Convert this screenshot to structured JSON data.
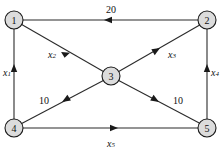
{
  "figure": {
    "kind": "directed-network-diagram",
    "width": 222,
    "height": 153,
    "background": "#ffffff"
  },
  "style": {
    "node_fill": "#dcdcdc",
    "node_stroke": "#1a1a1a",
    "edge_color": "#2b2b2b",
    "label_color": "#111111"
  },
  "nodes": [
    {
      "id": "1",
      "label": "1",
      "x": 14,
      "y": 20,
      "r": 9
    },
    {
      "id": "2",
      "label": "2",
      "x": 207,
      "y": 20,
      "r": 9
    },
    {
      "id": "3",
      "label": "3",
      "x": 111,
      "y": 76,
      "r": 9
    },
    {
      "id": "4",
      "label": "4",
      "x": 14,
      "y": 128,
      "r": 9
    },
    {
      "id": "5",
      "label": "5",
      "x": 207,
      "y": 128,
      "r": 9
    }
  ],
  "edges": [
    {
      "id": "e-2-1",
      "from": "2",
      "to": "1",
      "label": "20",
      "label_sub": "",
      "label_x": 111,
      "label_y": 9,
      "direction": "left"
    },
    {
      "id": "e-4-1",
      "from": "4",
      "to": "1",
      "label": "x",
      "label_sub": "1",
      "label_x": 7,
      "label_y": 72,
      "direction": "up"
    },
    {
      "id": "e-1-3",
      "from": "1",
      "to": "3",
      "label": "x",
      "label_sub": "2",
      "label_x": 52,
      "label_y": 54,
      "direction": "down-right"
    },
    {
      "id": "e-3-2",
      "from": "3",
      "to": "2",
      "label": "x",
      "label_sub": "3",
      "label_x": 172,
      "label_y": 54,
      "direction": "up-right"
    },
    {
      "id": "e-5-2",
      "from": "5",
      "to": "2",
      "label": "x",
      "label_sub": "4",
      "label_x": 214,
      "label_y": 72,
      "direction": "up"
    },
    {
      "id": "e-3-4",
      "from": "3",
      "to": "4",
      "label": "10",
      "label_sub": "",
      "label_x": 44,
      "label_y": 100,
      "direction": "down-left"
    },
    {
      "id": "e-3-5",
      "from": "3",
      "to": "5",
      "label": "10",
      "label_sub": "",
      "label_x": 178,
      "label_y": 100,
      "direction": "down-right"
    },
    {
      "id": "e-4-5",
      "from": "4",
      "to": "5",
      "label": "x",
      "label_sub": "5",
      "label_x": 111,
      "label_y": 143,
      "direction": "right"
    }
  ]
}
